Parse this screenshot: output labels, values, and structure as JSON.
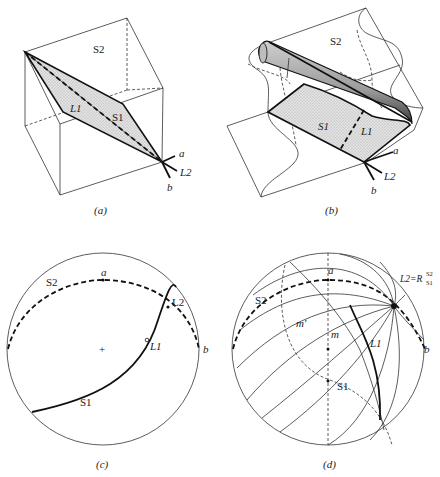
{
  "figure": {
    "panels": [
      {
        "id": "a",
        "caption": "(a)",
        "type": "block-diagram",
        "labels": {
          "plane_top": "S2",
          "fold_plane": "S1",
          "lineation_1": "L1",
          "lineation_2": "L2",
          "axis_a": "a",
          "axis_b": "b"
        }
      },
      {
        "id": "b",
        "caption": "(b)",
        "type": "folded-block-diagram",
        "labels": {
          "plane_top": "S2",
          "fold_plane": "S1",
          "lineation_1": "L1",
          "lineation_2": "L2",
          "axis_a": "a",
          "axis_b": "b"
        }
      },
      {
        "id": "c",
        "caption": "(c)",
        "type": "stereonet",
        "labels": {
          "great_circle_1": "S1",
          "great_circle_2": "S2",
          "lineation_1": "L1",
          "lineation_2": "L2",
          "axis_a": "a",
          "axis_b": "b",
          "center_mark": "+"
        }
      },
      {
        "id": "d",
        "caption": "(d)",
        "type": "stereonet-rotation",
        "labels": {
          "great_circle_1": "S1",
          "great_circle_2": "S2",
          "lineation_1": "L1",
          "rotation_axis": "L2=R",
          "rotation_sup": "S2",
          "rotation_sub": "S1",
          "axis_a": "a",
          "axis_b": "b",
          "point_m": "m",
          "point_m_prime": "m′"
        }
      }
    ]
  }
}
